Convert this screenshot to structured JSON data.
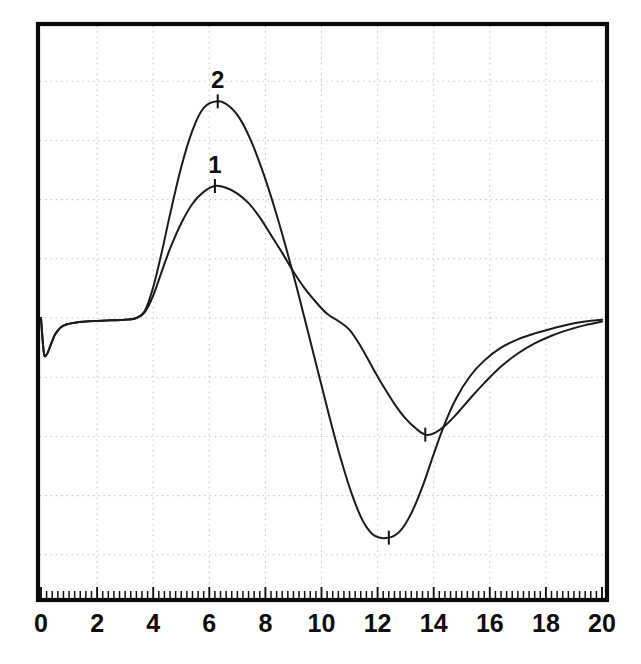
{
  "chart_data": {
    "type": "line",
    "title": "",
    "subtitle": "",
    "xlabel": "",
    "ylabel": "",
    "xlim": [
      0,
      20
    ],
    "ylim": [
      -4.05,
      5.05
    ],
    "grid": true,
    "grid_style": "dotted",
    "legend": "inline-curve-labels",
    "x_ticks_major": [
      0,
      2,
      4,
      6,
      8,
      10,
      12,
      14,
      16,
      18,
      20
    ],
    "x_tick_labels": [
      "0",
      "2",
      "4",
      "6",
      "8",
      "10",
      "12",
      "14",
      "16",
      "18",
      "20"
    ],
    "x_minor_tick_step": 0.2,
    "y_ticks_major": [
      -4,
      -3,
      -2,
      -1,
      0,
      1,
      2,
      3,
      4
    ],
    "y_tick_labels": [],
    "y_axis_labels_shown": false,
    "baseline_value": 0,
    "annotations": [
      {
        "text": "2",
        "curve": "2",
        "x": 6.3,
        "y": 3.66,
        "kind": "curve-label-at-peak"
      },
      {
        "text": "1",
        "curve": "1",
        "x": 6.2,
        "y": 2.23,
        "kind": "curve-label-at-peak"
      }
    ],
    "markers": [
      {
        "curve": "2",
        "x": 6.3,
        "y": 3.66,
        "kind": "peak"
      },
      {
        "curve": "2",
        "x": 12.4,
        "y": -3.71,
        "kind": "trough"
      },
      {
        "curve": "1",
        "x": 6.2,
        "y": 2.23,
        "kind": "peak"
      },
      {
        "curve": "1",
        "x": 13.7,
        "y": -1.97,
        "kind": "trough"
      }
    ],
    "series": [
      {
        "name": "1",
        "label": "1",
        "color": "#1b1b1b",
        "x": [
          0.0,
          0.1,
          0.2,
          0.35,
          0.5,
          0.7,
          0.9,
          1.2,
          1.6,
          2.0,
          2.5,
          3.0,
          3.4,
          3.7,
          4.0,
          4.3,
          4.6,
          5.0,
          5.4,
          5.8,
          6.2,
          6.6,
          7.0,
          7.4,
          7.8,
          8.2,
          8.6,
          9.0,
          9.4,
          9.8,
          10.2,
          10.6,
          11.0,
          11.4,
          11.8,
          12.2,
          12.6,
          13.0,
          13.4,
          13.7,
          14.0,
          14.4,
          14.8,
          15.3,
          15.8,
          16.4,
          17.0,
          17.6,
          18.2,
          18.8,
          19.4,
          20.0
        ],
        "y": [
          0.0,
          -0.58,
          -0.62,
          -0.45,
          -0.28,
          -0.16,
          -0.11,
          -0.08,
          -0.06,
          -0.05,
          -0.04,
          -0.03,
          0.0,
          0.1,
          0.38,
          0.78,
          1.17,
          1.6,
          1.93,
          2.13,
          2.23,
          2.2,
          2.1,
          1.94,
          1.7,
          1.4,
          1.1,
          0.78,
          0.5,
          0.27,
          0.07,
          -0.05,
          -0.2,
          -0.48,
          -0.82,
          -1.15,
          -1.45,
          -1.7,
          -1.88,
          -1.97,
          -1.95,
          -1.82,
          -1.63,
          -1.36,
          -1.1,
          -0.82,
          -0.6,
          -0.43,
          -0.3,
          -0.2,
          -0.12,
          -0.06
        ]
      },
      {
        "name": "2",
        "label": "2",
        "color": "#1b1b1b",
        "x": [
          0.0,
          0.1,
          0.2,
          0.35,
          0.5,
          0.7,
          0.9,
          1.2,
          1.6,
          2.0,
          2.5,
          3.0,
          3.4,
          3.7,
          4.0,
          4.3,
          4.6,
          5.0,
          5.4,
          5.8,
          6.3,
          6.7,
          7.1,
          7.5,
          7.9,
          8.3,
          8.7,
          9.1,
          9.5,
          9.9,
          10.3,
          10.7,
          11.1,
          11.5,
          11.9,
          12.4,
          12.8,
          13.2,
          13.6,
          14.0,
          14.4,
          14.8,
          15.3,
          15.8,
          16.4,
          17.0,
          17.6,
          18.2,
          18.8,
          19.4,
          20.0
        ],
        "y": [
          0.0,
          -0.58,
          -0.62,
          -0.45,
          -0.28,
          -0.16,
          -0.11,
          -0.08,
          -0.06,
          -0.05,
          -0.04,
          -0.03,
          0.0,
          0.12,
          0.52,
          1.1,
          1.75,
          2.55,
          3.17,
          3.55,
          3.66,
          3.58,
          3.36,
          2.98,
          2.48,
          1.9,
          1.25,
          0.55,
          -0.2,
          -0.95,
          -1.7,
          -2.4,
          -3.0,
          -3.45,
          -3.68,
          -3.71,
          -3.6,
          -3.3,
          -2.85,
          -2.3,
          -1.78,
          -1.36,
          -0.98,
          -0.72,
          -0.5,
          -0.36,
          -0.26,
          -0.18,
          -0.11,
          -0.06,
          -0.03
        ]
      }
    ]
  },
  "figure": {
    "background_color": "#ffffff",
    "frame_color": "#0a0a0a",
    "grid_color": "#b9b9b9",
    "curve_color": "#1b1b1b"
  }
}
